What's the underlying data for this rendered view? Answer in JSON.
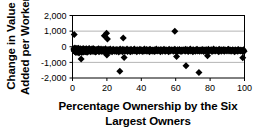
{
  "chart_data": {
    "type": "scatter",
    "title": "",
    "xlabel": "Percentage Ownership by the Six Largest Owners",
    "xlabel_line1": "Percentage Ownership by the Six",
    "xlabel_line2": "Largest Owners",
    "ylabel": "Change in Value Added per Worker",
    "ylabel_line1": "Change in Value",
    "ylabel_line2": "Added per Worker",
    "xlim": [
      0,
      100
    ],
    "ylim": [
      -2000,
      2000
    ],
    "xticks": [
      0,
      20,
      40,
      60,
      80,
      100
    ],
    "xtick_labels": [
      "0",
      "20",
      "40",
      "60",
      "80",
      "100"
    ],
    "yticks": [
      -2000,
      -1000,
      0,
      1000,
      2000
    ],
    "ytick_labels": [
      "-2,000",
      "-1,000",
      "0",
      "1,000",
      "2,000"
    ],
    "grid": true,
    "gridlines_y": [
      -1000,
      1000
    ],
    "grid_color": "#b4b4b4",
    "legend": null,
    "marker": "diamond",
    "marker_color": "#000000",
    "marker_size": 3.1,
    "frame_color": "#000000",
    "background_color": "#ffffff",
    "x": [
      0.5,
      0.7,
      0.9,
      1.1,
      1.2,
      1.4,
      1.5,
      1.7,
      1.8,
      2.0,
      2.2,
      2.3,
      2.5,
      2.6,
      2.8,
      3.0,
      3.1,
      3.3,
      3.4,
      3.6,
      3.8,
      3.9,
      4.1,
      4.2,
      4.4,
      4.6,
      4.7,
      4.9,
      5.0,
      5.2,
      5.4,
      5.5,
      5.7,
      5.8,
      6.0,
      6.2,
      6.3,
      6.5,
      6.6,
      6.8,
      7.0,
      7.1,
      7.3,
      7.5,
      7.6,
      7.8,
      8.0,
      8.1,
      8.3,
      8.5,
      8.7,
      8.9,
      9.1,
      9.3,
      9.5,
      9.7,
      9.9,
      10.1,
      10.4,
      10.6,
      10.8,
      11.0,
      11.2,
      11.4,
      11.6,
      11.8,
      12.0,
      12.3,
      12.5,
      12.7,
      12.9,
      13.1,
      13.4,
      13.6,
      13.8,
      14.0,
      14.3,
      14.5,
      14.7,
      15.0,
      15.2,
      15.4,
      15.7,
      15.9,
      16.1,
      16.4,
      16.6,
      16.8,
      17.1,
      17.3,
      17.5,
      17.8,
      18.0,
      18.3,
      18.5,
      18.7,
      19.0,
      19.2,
      19.5,
      19.7,
      20.0,
      20.2,
      20.5,
      20.7,
      21.0,
      21.2,
      21.5,
      21.7,
      22.0,
      22.2,
      22.5,
      22.7,
      23.0,
      23.2,
      23.5,
      23.7,
      24.0,
      24.3,
      24.5,
      24.8,
      25.0,
      25.3,
      25.5,
      25.8,
      26.1,
      26.3,
      26.6,
      26.9,
      27.1,
      27.4,
      27.7,
      27.9,
      28.2,
      28.5,
      28.7,
      29.0,
      29.3,
      29.5,
      29.8,
      30.1,
      30.4,
      30.6,
      30.9,
      31.2,
      31.5,
      31.7,
      32.0,
      32.3,
      32.6,
      32.9,
      33.1,
      33.4,
      33.7,
      34.0,
      34.3,
      34.5,
      34.8,
      35.1,
      35.4,
      35.7,
      36.0,
      36.3,
      36.5,
      36.8,
      37.1,
      37.4,
      37.7,
      38.0,
      38.3,
      38.6,
      38.9,
      39.2,
      39.4,
      39.7,
      40.0,
      40.3,
      40.6,
      40.9,
      41.2,
      41.5,
      41.8,
      42.1,
      42.4,
      42.7,
      43.0,
      43.3,
      43.6,
      43.9,
      44.2,
      44.5,
      44.8,
      45.1,
      45.4,
      45.7,
      46.0,
      46.3,
      46.6,
      46.9,
      47.2,
      47.5,
      47.8,
      48.1,
      48.4,
      48.7,
      49.0,
      49.3,
      49.6,
      49.9,
      50.2,
      50.5,
      50.8,
      51.1,
      51.4,
      51.7,
      52.0,
      52.3,
      52.6,
      52.9,
      53.2,
      53.5,
      53.8,
      54.1,
      54.4,
      54.7,
      55.0,
      55.3,
      55.6,
      55.9,
      56.2,
      56.5,
      56.8,
      57.1,
      57.4,
      57.7,
      58.0,
      58.3,
      58.6,
      58.9,
      59.2,
      59.5,
      59.8,
      60.1,
      60.4,
      60.7,
      61.0,
      61.3,
      61.6,
      61.9,
      62.2,
      62.5,
      62.8,
      63.1,
      63.4,
      63.7,
      64.0,
      64.3,
      64.6,
      64.9,
      65.2,
      65.5,
      65.8,
      66.1,
      66.4,
      66.7,
      67.0,
      67.3,
      67.6,
      67.9,
      68.2,
      68.5,
      68.8,
      69.1,
      69.4,
      69.7,
      70.0,
      70.3,
      70.6,
      70.9,
      71.2,
      71.5,
      71.8,
      72.1,
      72.4,
      72.7,
      73.0,
      73.3,
      73.6,
      73.9,
      74.2,
      74.5,
      74.8,
      75.1,
      75.4,
      75.7,
      76.0,
      76.3,
      76.6,
      76.9,
      77.2,
      77.5,
      77.8,
      78.1,
      78.4,
      78.7,
      79.0,
      79.3,
      79.6,
      79.9,
      80.2,
      80.5,
      80.8,
      81.1,
      81.4,
      81.7,
      82.0,
      82.3,
      82.6,
      82.9,
      83.2,
      83.5,
      83.8,
      84.1,
      84.4,
      84.7,
      85.0,
      85.3,
      85.6,
      85.9,
      86.2,
      86.5,
      86.8,
      87.1,
      87.4,
      87.7,
      88.0,
      88.3,
      88.6,
      88.9,
      89.2,
      89.5,
      89.8,
      90.1,
      90.4,
      90.7,
      91.0,
      91.3,
      91.6,
      91.9,
      92.2,
      92.5,
      92.8,
      93.1,
      93.4,
      93.7,
      94.0,
      94.3,
      94.6,
      94.9,
      95.2,
      95.5,
      95.8,
      96.1,
      96.4,
      96.7,
      97.0,
      97.3,
      97.6,
      97.9,
      98.2,
      98.5,
      98.8,
      99.1,
      99.4,
      99.7,
      100.0
    ],
    "y": [
      -150,
      -260,
      -80,
      -310,
      -200,
      -60,
      -340,
      -180,
      -120,
      -400,
      -220,
      -90,
      -290,
      -160,
      -380,
      -110,
      -250,
      -330,
      -70,
      -200,
      -420,
      -140,
      -280,
      -190,
      -350,
      -100,
      -230,
      -300,
      -170,
      -260,
      -390,
      -130,
      -210,
      -320,
      -180,
      -90,
      -270,
      -360,
      -150,
      -240,
      -310,
      -200,
      -120,
      -280,
      -340,
      -170,
      -230,
      -100,
      -290,
      -380,
      -190,
      -260,
      -140,
      -320,
      -210,
      -80,
      -300,
      -240,
      -160,
      -350,
      -190,
      -270,
      -120,
      -230,
      -310,
      -180,
      -90,
      -250,
      -330,
      -200,
      -140,
      -290,
      -360,
      -170,
      -220,
      -310,
      -130,
      -240,
      -280,
      -190,
      -100,
      -350,
      -210,
      -160,
      -300,
      -250,
      -120,
      -270,
      -330,
      -180,
      -230,
      -140,
      -290,
      -200,
      -360,
      -170,
      -250,
      -110,
      -310,
      -220,
      -280,
      -190,
      -340,
      -150,
      -230,
      -300,
      -170,
      -260,
      -120,
      -320,
      -200,
      -240,
      -350,
      -180,
      -290,
      -130,
      -220,
      -270,
      -310,
      -160,
      -240,
      -200,
      -330,
      -150,
      -280,
      -190,
      -250,
      -360,
      -170,
      -230,
      -120,
      -300,
      -210,
      -270,
      -180,
      -340,
      -140,
      -250,
      -200,
      -290,
      -160,
      -310,
      -230,
      -180,
      -270,
      -120,
      -330,
      -200,
      -250,
      -170,
      -290,
      -220,
      -350,
      -140,
      -260,
      -190,
      -310,
      -230,
      -170,
      -280,
      -120,
      -300,
      -210,
      -250,
      -180,
      -340,
      -160,
      -230,
      -270,
      -190,
      -310,
      -140,
      -250,
      -200,
      -290,
      -170,
      -230,
      -330,
      -180,
      -260,
      -120,
      -300,
      -210,
      -270,
      -150,
      -320,
      -190,
      -240,
      -280,
      -170,
      -350,
      -130,
      -220,
      -260,
      -200,
      -310,
      -180,
      -240,
      -290,
      -160,
      -330,
      -200,
      -250,
      -120,
      -280,
      -210,
      -300,
      -170,
      -230,
      -270,
      -190,
      -340,
      -150,
      -260,
      -220,
      -310,
      -180,
      -240,
      -130,
      -290,
      -200,
      -320,
      -170,
      -250,
      -220,
      -280,
      -190,
      -350,
      -140,
      -230,
      -270,
      -300,
      -160,
      -210,
      -240,
      -190,
      -310,
      -180,
      -260,
      -130,
      -290,
      -220,
      -250,
      -340,
      -170,
      -230,
      -200,
      -300,
      -150,
      -270,
      -210,
      -330,
      -180,
      -240,
      -290,
      -160,
      -220,
      -260,
      -190,
      -310,
      -140,
      -250,
      -200,
      -280,
      -170,
      -330,
      -230,
      -180,
      -270,
      -120,
      -300,
      -210,
      -240,
      -190,
      -350,
      -160,
      -230,
      -280,
      -200,
      -310,
      -170,
      -250,
      -130,
      -290,
      -220,
      -260,
      -180,
      -320,
      -200,
      -240,
      -170,
      -290,
      -210,
      -150,
      -270,
      -330,
      -190,
      -230,
      -180,
      -300,
      -160,
      -250,
      -220,
      -280,
      -140,
      -310,
      -200,
      -240,
      -190,
      -270,
      -170,
      -330,
      -210,
      -250,
      -120,
      -290,
      -180,
      -230,
      -300,
      -160,
      -240,
      -210,
      -280,
      -190,
      -350,
      -140,
      -260,
      -220,
      -190,
      -310,
      -170,
      -250,
      -200,
      -280,
      -150,
      -320,
      -230,
      -180,
      -260,
      -210,
      -290,
      -170,
      -240,
      -130,
      -300,
      -200,
      -270,
      -180,
      -310,
      -220,
      -250,
      -160,
      -290,
      -200,
      -230,
      -340,
      -170,
      -260,
      -210,
      -280,
      -190,
      -320,
      -150,
      -240,
      -270,
      -200,
      -300,
      -180,
      -230,
      -260,
      -210,
      -350,
      -170,
      -240,
      -290,
      -200,
      -310,
      -230,
      -180,
      -270,
      -150,
      -330,
      -220,
      -260,
      -200,
      -290,
      -410,
      -520,
      -300,
      -480,
      -700
    ],
    "outliers": [
      {
        "x": 1.0,
        "y": 780
      },
      {
        "x": 5.0,
        "y": -780
      },
      {
        "x": 18.5,
        "y": 700
      },
      {
        "x": 19.8,
        "y": 860
      },
      {
        "x": 20.3,
        "y": 500
      },
      {
        "x": 20.0,
        "y": -520
      },
      {
        "x": 27.5,
        "y": -1560
      },
      {
        "x": 29.5,
        "y": 560
      },
      {
        "x": 30.0,
        "y": -680
      },
      {
        "x": 59.5,
        "y": 1000
      },
      {
        "x": 60.5,
        "y": -620
      },
      {
        "x": 66.0,
        "y": -1220
      },
      {
        "x": 73.5,
        "y": -1650
      },
      {
        "x": 78.5,
        "y": -580
      },
      {
        "x": 99.0,
        "y": -700
      }
    ]
  },
  "axis": {
    "y_tick_labels": [
      "2,000",
      "1,000",
      "0",
      "-1,000",
      "-2,000"
    ],
    "x_tick_labels": [
      "0",
      "20",
      "40",
      "60",
      "80",
      "100"
    ]
  },
  "labels": {
    "y_axis_line1": "Change in Value",
    "y_axis_line2": "Added per Worker",
    "x_axis_line1": "Percentage Ownership by the Six",
    "x_axis_line2": "Largest Owners"
  }
}
